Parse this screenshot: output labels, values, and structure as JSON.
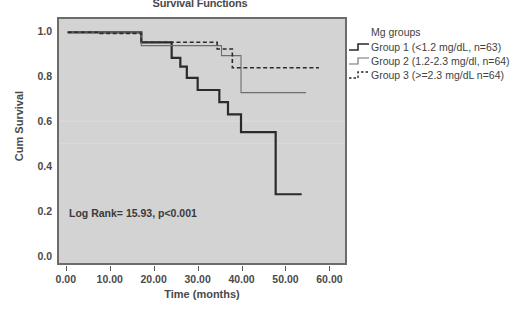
{
  "chart_data": {
    "type": "line",
    "title": "Survival Functions",
    "xlabel": "Time (months)",
    "ylabel": "Cum Survival",
    "xlim": [
      -2,
      64
    ],
    "ylim": [
      -0.04,
      1.06
    ],
    "xticks": [
      "0.00",
      "10.00",
      "20.00",
      "30.00",
      "40.00",
      "50.00",
      "60.00"
    ],
    "xtick_values": [
      0,
      10,
      20,
      30,
      40,
      50,
      60
    ],
    "yticks": [
      "0.0",
      "0.2",
      "0.4",
      "0.6",
      "0.8",
      "1.0"
    ],
    "ytick_values": [
      0.0,
      0.2,
      0.4,
      0.6,
      0.8,
      1.0
    ],
    "grid": false,
    "legend_position": "right",
    "annotation": "Log Rank= 15.93, p<0.001",
    "series": [
      {
        "name": "Group 1 (<1.2 mg/dL, n=63)",
        "style": "solid-thick",
        "color": "#2b2b2b",
        "width": 2.2,
        "x": [
          0,
          17,
          17,
          24,
          24,
          26,
          26,
          27.5,
          27.5,
          30,
          30,
          35,
          35,
          37,
          37,
          40,
          40,
          48,
          48,
          54
        ],
        "y": [
          1.0,
          1.0,
          0.955,
          0.955,
          0.885,
          0.885,
          0.845,
          0.845,
          0.795,
          0.795,
          0.74,
          0.74,
          0.685,
          0.685,
          0.63,
          0.63,
          0.55,
          0.55,
          0.27,
          0.27
        ]
      },
      {
        "name": "Group 2 (1.2-2.3 mg/dl, n=64)",
        "style": "solid-thin",
        "color": "#6e6e6e",
        "width": 1.1,
        "x": [
          0,
          17,
          17,
          35.5,
          35.5,
          40,
          40,
          55
        ],
        "y": [
          1.0,
          1.0,
          0.94,
          0.94,
          0.895,
          0.895,
          0.728,
          0.728
        ]
      },
      {
        "name": "Group 3 (>=2.3 mg/dL n=64)",
        "style": "dashed",
        "color": "#2b2b2b",
        "width": 1.6,
        "x": [
          0,
          7.5,
          7.5,
          17,
          17,
          34.5,
          34.5,
          38,
          38,
          58
        ],
        "y": [
          1.0,
          1.0,
          0.995,
          0.995,
          0.955,
          0.955,
          0.925,
          0.925,
          0.84,
          0.84
        ]
      }
    ]
  },
  "legend": {
    "title": "Mg groups",
    "items": [
      {
        "label": "Group 1 (<1.2 mg/dL, n=63)",
        "sample": "step-solid-thick"
      },
      {
        "label": "Group 2 (1.2-2.3 mg/dl, n=64)",
        "sample": "step-solid-thin"
      },
      {
        "label": "Group 3 (>=2.3 mg/dL n=64)",
        "sample": "step-dashed"
      }
    ]
  },
  "colors": {
    "plot_background": "#d3d3d3",
    "frame": "#6b6b6b",
    "series_1": "#2b2b2b",
    "series_2": "#6e6e6e",
    "series_3": "#2b2b2b",
    "text": "#3f3f3f"
  }
}
